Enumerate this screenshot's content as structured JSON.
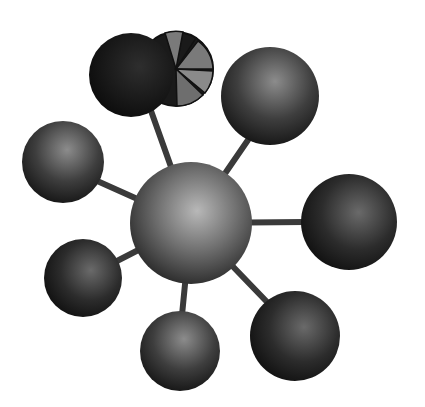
{
  "diagram": {
    "type": "hub-and-spoke network (3D spheres)",
    "background": "#ffffff",
    "hub": {
      "id": "center",
      "cx": 191,
      "cy": 223,
      "r": 61,
      "tone": "light"
    },
    "nodes": [
      {
        "id": "top-left-dark",
        "cx": 131,
        "cy": 75,
        "r": 42,
        "tone": "black"
      },
      {
        "id": "top-right",
        "cx": 270,
        "cy": 96,
        "r": 49,
        "tone": "mid"
      },
      {
        "id": "left",
        "cx": 63,
        "cy": 162,
        "r": 41,
        "tone": "mid"
      },
      {
        "id": "right",
        "cx": 349,
        "cy": 222,
        "r": 48,
        "tone": "dark"
      },
      {
        "id": "lower-left",
        "cx": 83,
        "cy": 278,
        "r": 39,
        "tone": "dark"
      },
      {
        "id": "bottom",
        "cx": 180,
        "cy": 351,
        "r": 40,
        "tone": "mid"
      },
      {
        "id": "bottom-right",
        "cx": 295,
        "cy": 336,
        "r": 45,
        "tone": "dark"
      }
    ],
    "pie_disk": {
      "cx": 176,
      "cy": 69,
      "r": 37,
      "segments": [
        "gray",
        "dark",
        "gray",
        "dark",
        "gray",
        "gray",
        "dark",
        "dark"
      ]
    },
    "colors": {
      "link": "#3a3a3a",
      "black": "#111111",
      "dark": "#2a2a2a",
      "mid": "#3c3c3c",
      "light": "#8a8a8a",
      "pie_gray": "#7a7a7a"
    }
  }
}
